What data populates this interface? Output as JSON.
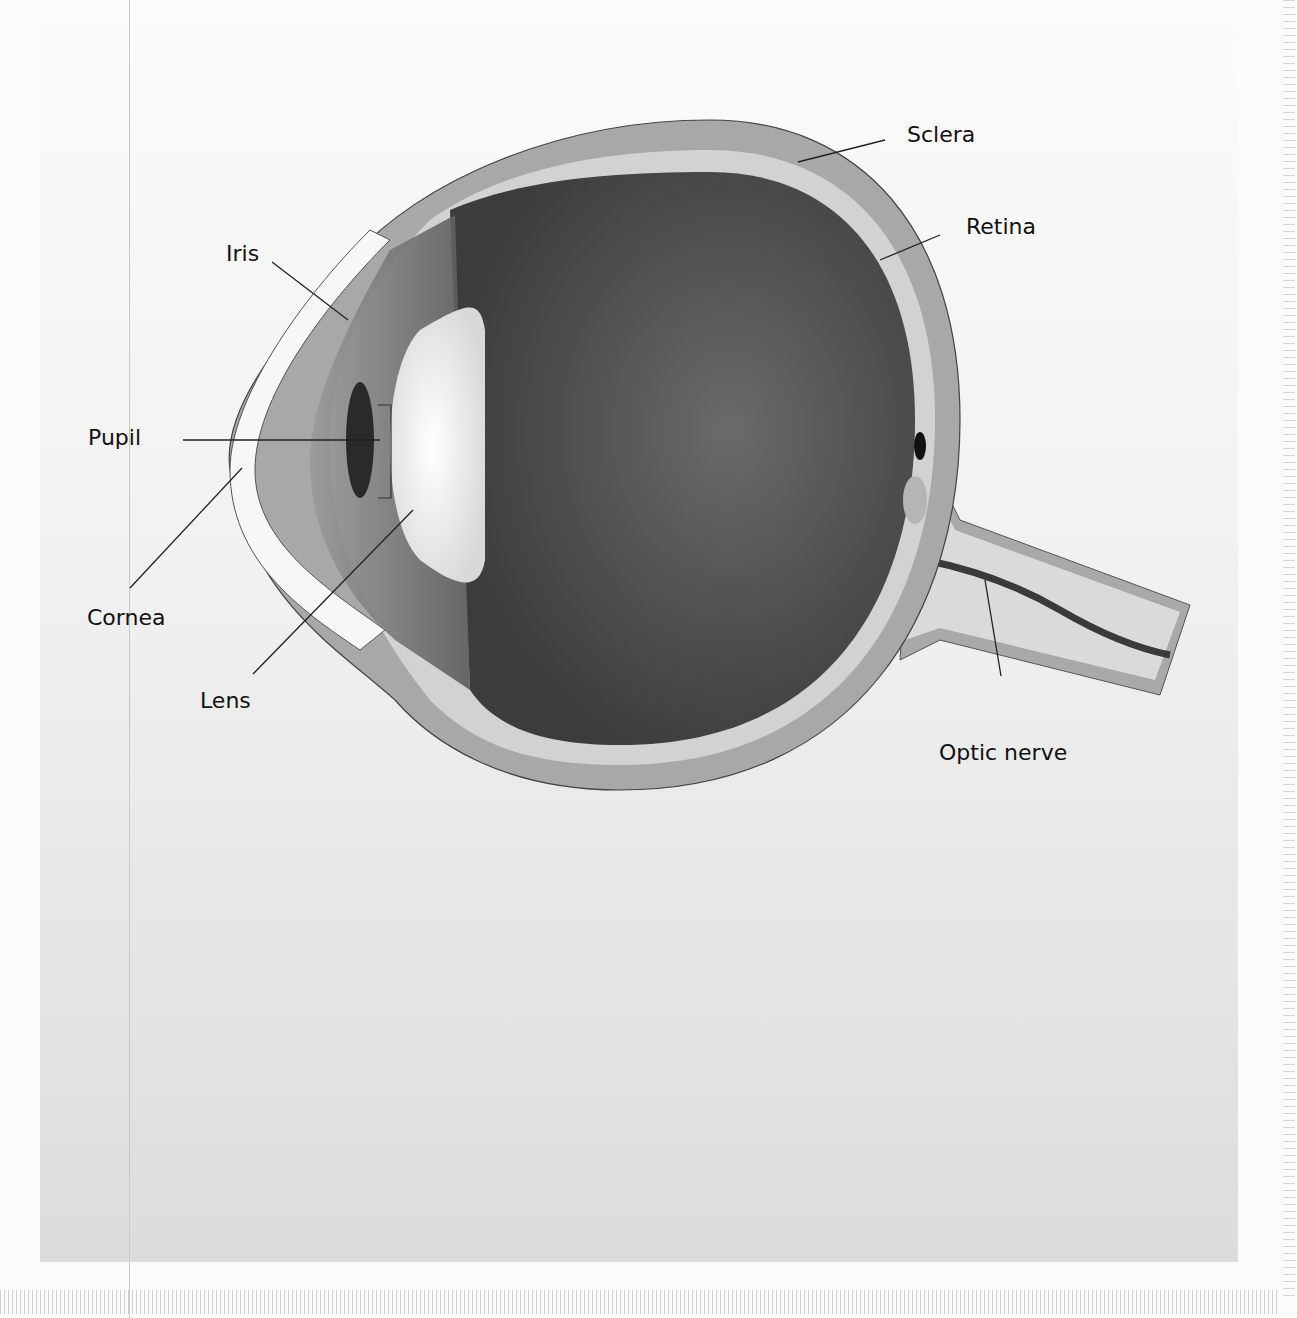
{
  "diagram": {
    "labels": [
      {
        "id": "sclera",
        "text": "Sclera"
      },
      {
        "id": "retina",
        "text": "Retina"
      },
      {
        "id": "iris",
        "text": "Iris"
      },
      {
        "id": "pupil",
        "text": "Pupil"
      },
      {
        "id": "cornea",
        "text": "Cornea"
      },
      {
        "id": "lens",
        "text": "Lens"
      },
      {
        "id": "optic_nerve",
        "text": "Optic nerve"
      }
    ]
  },
  "colors": {
    "background": "#f2f2f2",
    "sclera": "#a9a9a9",
    "retina": "#d4d4d4",
    "vitreous": "#4a4a4a",
    "lens": "#f4f4f4",
    "label": "#111111"
  }
}
